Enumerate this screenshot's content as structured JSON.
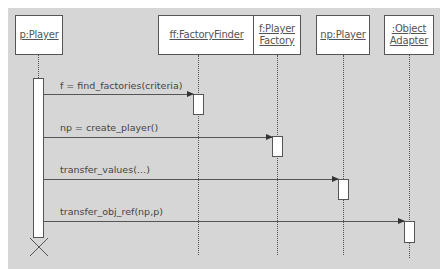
{
  "diagram": {
    "type": "UML sequence diagram",
    "colors": {
      "background": "#d6d6d6",
      "box": "#ffffff",
      "line": "#555555"
    },
    "objects": [
      {
        "name": "p:Player"
      },
      {
        "name": "ff:FactoryFinder"
      },
      {
        "name": "f:Player\nFactory"
      },
      {
        "name": "np:Player"
      },
      {
        "name": ":Object\nAdapter"
      }
    ],
    "messages": [
      {
        "label": "f = find_factories(criteria)",
        "from": "p:Player",
        "to": "ff:FactoryFinder"
      },
      {
        "label": "np = create_player()",
        "from": "p:Player",
        "to": "f:Player Factory"
      },
      {
        "label": "transfer_values(…)",
        "from": "p:Player",
        "to": "np:Player"
      },
      {
        "label": "transfer_obj_ref(np,p)",
        "from": "p:Player",
        "to": ":Object Adapter"
      }
    ],
    "destruction_marker": "X"
  }
}
